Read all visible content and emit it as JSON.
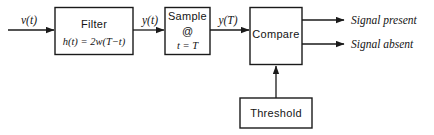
{
  "diagram": {
    "colors": {
      "stroke": "#1a1a1a",
      "text": "#141414",
      "background": "#ffffff"
    },
    "blocks": [
      {
        "id": "filter",
        "label": "Filter",
        "formula": "h(t) = 2w(T−t)"
      },
      {
        "id": "sample",
        "label": "Sample",
        "at": "@",
        "condition": "t = T"
      },
      {
        "id": "compare",
        "label": "Compare"
      },
      {
        "id": "threshold",
        "label": "Threshold"
      }
    ],
    "signals": {
      "input": "v(t)",
      "filter_output": "y(t)",
      "sample_output": "y(T)"
    },
    "outputs": [
      {
        "id": "present",
        "label": "Signal present"
      },
      {
        "id": "absent",
        "label": "Signal absent"
      }
    ]
  }
}
